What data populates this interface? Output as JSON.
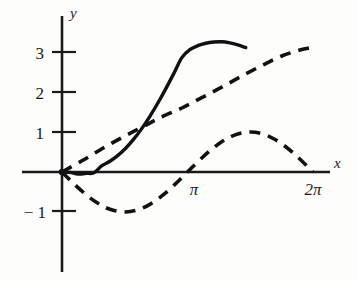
{
  "chart_data": {
    "type": "line",
    "title": "",
    "xlabel": "x",
    "ylabel": "y",
    "xlim": [
      -0.15,
      6.85
    ],
    "ylim": [
      -1.75,
      3.9
    ],
    "grid": false,
    "legend": "none",
    "x_ticks": [
      {
        "value": 3.14159,
        "label": "π"
      },
      {
        "value": 6.28319,
        "label": "2π"
      }
    ],
    "y_ticks": [
      {
        "value": 3,
        "label": "3"
      },
      {
        "value": 2,
        "label": "2"
      },
      {
        "value": 1,
        "label": "1"
      },
      {
        "value": -1,
        "label": "− 1"
      }
    ],
    "series": [
      {
        "name": "x - sin(x)",
        "style": "solid",
        "points": [
          [
            0.0,
            0.0
          ],
          [
            0.2,
            -0.0087
          ],
          [
            0.4,
            -0.0507
          ],
          [
            0.6,
            -0.0353
          ],
          [
            0.8,
            -0.0173
          ],
          [
            1.0,
            0.1585
          ],
          [
            1.2,
            0.268
          ],
          [
            1.4,
            0.4146
          ],
          [
            1.6,
            0.6003
          ],
          [
            1.8,
            0.8262
          ],
          [
            2.0,
            1.0907
          ],
          [
            2.2,
            1.3915
          ],
          [
            2.4,
            1.7246
          ],
          [
            2.6,
            2.0845
          ],
          [
            2.8,
            2.465
          ],
          [
            3.0,
            2.8589
          ],
          [
            3.2,
            3.0589
          ],
          [
            3.4,
            3.158
          ],
          [
            3.6,
            3.2179
          ],
          [
            3.8,
            3.2486
          ],
          [
            4.0,
            3.256
          ],
          [
            4.2,
            3.23
          ],
          [
            4.4,
            3.178
          ],
          [
            4.6,
            3.11
          ]
        ]
      },
      {
        "name": "straight dashed line through origin",
        "style": "dashed",
        "points": [
          [
            0.0,
            0.0
          ],
          [
            0.5,
            0.28
          ],
          [
            1.0,
            0.58
          ],
          [
            1.5,
            0.86
          ],
          [
            2.0,
            1.12
          ],
          [
            2.5,
            1.38
          ],
          [
            3.0,
            1.6
          ],
          [
            3.5,
            1.86
          ],
          [
            4.0,
            2.12
          ],
          [
            4.5,
            2.4
          ],
          [
            5.0,
            2.66
          ],
          [
            5.5,
            2.9
          ],
          [
            6.0,
            3.06
          ],
          [
            6.28319,
            3.12
          ]
        ]
      },
      {
        "name": "-sin(x)",
        "style": "dashed",
        "points": [
          [
            0.0,
            0.0
          ],
          [
            0.3,
            -0.2955
          ],
          [
            0.6,
            -0.5646
          ],
          [
            0.9,
            -0.7833
          ],
          [
            1.2,
            -0.932
          ],
          [
            1.571,
            -1.0
          ],
          [
            1.9,
            -0.9463
          ],
          [
            2.2,
            -0.8085
          ],
          [
            2.5,
            -0.5985
          ],
          [
            2.8,
            -0.335
          ],
          [
            3.14159,
            0.0
          ],
          [
            3.5,
            0.3508
          ],
          [
            3.8,
            0.6119
          ],
          [
            4.1,
            0.8183
          ],
          [
            4.4,
            0.9516
          ],
          [
            4.712,
            1.0
          ],
          [
            5.0,
            0.9589
          ],
          [
            5.3,
            0.8323
          ],
          [
            5.6,
            0.6313
          ],
          [
            5.9,
            0.3739
          ],
          [
            6.28319,
            0.0
          ]
        ]
      }
    ]
  }
}
